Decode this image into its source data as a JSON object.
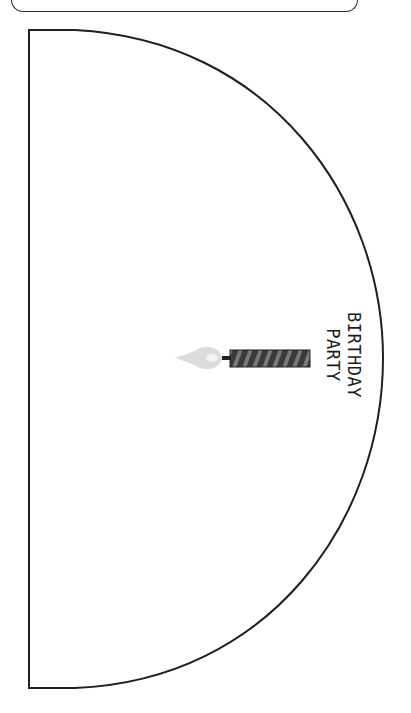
{
  "template": {
    "shape": "half-circle",
    "stroke_color": "#1f1f1f",
    "fill_color": "#ffffff"
  },
  "candle": {
    "body_color": "#3a3a3a",
    "stripe_color": "#7a7a7a",
    "flame_color": "#dcdcdc",
    "flame_inner_color": "#f4f4f4",
    "wick_color": "#222222"
  },
  "label": {
    "line1": "BIRTHDAY",
    "line2": "PARTY",
    "text_color": "#1a1a1a"
  }
}
